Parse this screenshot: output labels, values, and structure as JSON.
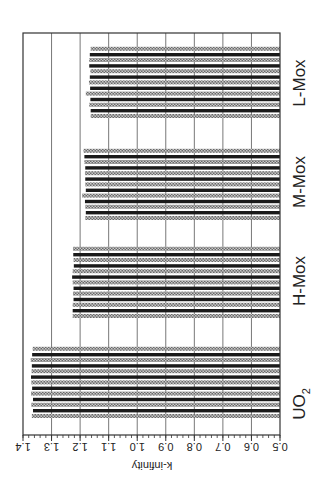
{
  "chart_data": {
    "type": "bar",
    "orientation": "vertical bars, image rotated 90° counter-clockwise",
    "title": "",
    "xlabel": "",
    "ylabel": "k-infinity",
    "ylim": [
      0.5,
      1.4
    ],
    "yticks": [
      "1.4",
      "1.3",
      "1.2",
      "1.1",
      "1.0",
      "0.9",
      "0.8",
      "0.7",
      "0.6",
      "0.5"
    ],
    "grid": true,
    "legend": null,
    "categories": [
      "UO2",
      "H-Mox",
      "M-Mox",
      "L-Mox"
    ],
    "category_labels": [
      {
        "main": "UO",
        "sub": "2"
      },
      {
        "main": "H-Mox",
        "sub": ""
      },
      {
        "main": "M-Mox",
        "sub": ""
      },
      {
        "main": "L-Mox",
        "sub": ""
      }
    ],
    "groups": [
      {
        "name": "UO2",
        "values": [
          1.369,
          1.365,
          1.371,
          1.365,
          1.372,
          1.368,
          1.371,
          1.372,
          1.37,
          1.369,
          1.373,
          1.368,
          1.366
        ]
      },
      {
        "name": "H-Mox",
        "values": [
          1.226,
          1.226,
          1.226,
          1.223,
          1.225,
          1.223,
          1.226,
          1.228,
          1.226,
          1.222,
          1.223,
          1.224,
          1.225
        ]
      },
      {
        "name": "M-Mox",
        "values": [
          1.182,
          1.18,
          1.182,
          1.183,
          1.193,
          1.18,
          1.182,
          1.182,
          1.183,
          1.182,
          1.185,
          1.185,
          1.188
        ]
      },
      {
        "name": "L-Mox",
        "values": [
          1.163,
          1.163,
          1.168,
          1.164,
          1.18,
          1.165,
          1.169,
          1.166,
          1.164,
          1.168,
          1.168,
          1.166,
          1.163
        ]
      }
    ],
    "bar_styles": [
      "hatched",
      "dark",
      "hatched",
      "dark",
      "hatched",
      "dark",
      "hatched",
      "dark",
      "hatched",
      "dark",
      "hatched",
      "dark",
      "hatched"
    ]
  },
  "axis": {
    "title": "k-infinity",
    "ticks": [
      "1.4",
      "1.3",
      "1.2",
      "1.1",
      "1.0",
      "0.9",
      "0.8",
      "0.7",
      "0.6",
      "0.5"
    ]
  },
  "labels": {
    "uo2_main": "UO",
    "uo2_sub": "2",
    "hmox": "H-Mox",
    "mmox": "M-Mox",
    "lmox": "L-Mox"
  },
  "colors": {
    "dark_bar": "#1a1a1a",
    "hatched_bar": "#8a8a8a",
    "grid": "#555555",
    "frame": "#333333"
  }
}
